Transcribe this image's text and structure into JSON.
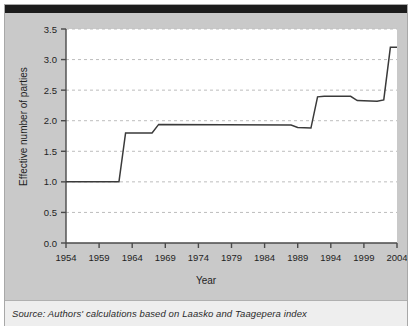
{
  "caption": {
    "source_text": "Source: Authors' calculations based on Laasko and Taagepera index"
  },
  "colors": {
    "page_background": "#ffffff",
    "panel_background": "#c9c9c9",
    "plot_background": "#ffffff",
    "top_bar": "#1c1c1c",
    "caption_background": "#eeeeee",
    "line": "#3a3a3a",
    "grid": "#bdbdbd",
    "axis": "#4a4a4a",
    "text": "#1f1f1f"
  },
  "chart_data": {
    "type": "line",
    "title": "",
    "xlabel": "Year",
    "ylabel": "Effective number of parties",
    "xlim": [
      1954,
      2004
    ],
    "ylim": [
      0.0,
      3.5
    ],
    "grid": true,
    "legend": false,
    "xticks": [
      1954,
      1959,
      1964,
      1969,
      1974,
      1979,
      1984,
      1989,
      1994,
      1999,
      2004
    ],
    "xtick_labels": [
      "1954",
      "1959",
      "1964",
      "1969",
      "1974",
      "1979",
      "1984",
      "1989",
      "1994",
      "1999",
      "2004"
    ],
    "yticks": [
      0.0,
      0.5,
      1.0,
      1.5,
      2.0,
      2.5,
      3.0,
      3.5
    ],
    "ytick_labels": [
      "0.0",
      "0.5",
      "1.0",
      "1.5",
      "2.0",
      "2.5",
      "3.0",
      "3.5"
    ],
    "series": [
      {
        "name": "Effective number of parties",
        "x": [
          1954,
          1962,
          1963,
          1967,
          1968,
          1988,
          1989,
          1991,
          1992,
          1993,
          1997,
          1998,
          2001,
          2002,
          2003,
          2004
        ],
        "values": [
          1.0,
          1.0,
          1.8,
          1.8,
          1.94,
          1.93,
          1.89,
          1.88,
          2.39,
          2.4,
          2.4,
          2.33,
          2.32,
          2.34,
          3.2,
          3.2
        ]
      }
    ]
  }
}
